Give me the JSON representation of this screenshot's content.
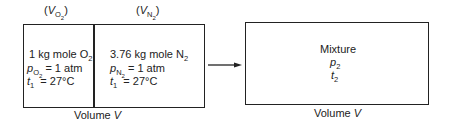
{
  "left": {
    "o2_volume_label": "V",
    "o2_volume_sub": "O",
    "o2_volume_subsub": "2",
    "n2_volume_label": "V",
    "n2_volume_sub": "N",
    "n2_volume_subsub": "2",
    "o2": {
      "line1": "1 kg mole O",
      "line1_sub": "2",
      "p_symbol": "p",
      "p_sub": "O",
      "p_subsub": "2",
      "p_value": "= 1 atm",
      "t_symbol": "t",
      "t_sub": "1",
      "t_value": "= 27°C"
    },
    "n2": {
      "line1": "3.76 kg mole N",
      "line1_sub": "2",
      "p_symbol": "p",
      "p_sub": "N",
      "p_subsub": "2",
      "p_value": "= 1 atm",
      "t_symbol": "t",
      "t_sub": "1",
      "t_value": "= 27°C"
    },
    "volume_caption": "Volume",
    "volume_symbol": "V"
  },
  "right": {
    "title": "Mixture",
    "p_symbol": "p",
    "p_sub": "2",
    "t_symbol": "t",
    "t_sub": "2",
    "volume_caption": "Volume",
    "volume_symbol": "V"
  }
}
